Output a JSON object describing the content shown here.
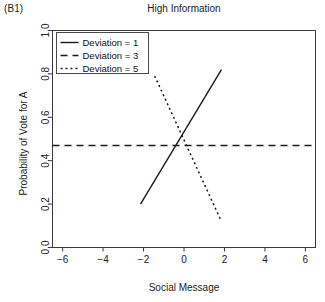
{
  "panel": {
    "label": "(B1)"
  },
  "chart_data": {
    "type": "line",
    "title": "High Information",
    "xlabel": "Social Message",
    "ylabel": "Probability of Vote for A",
    "xlim": [
      -6.5,
      6.5
    ],
    "ylim": [
      0.0,
      1.0
    ],
    "xticks": [
      -6,
      -4,
      -2,
      0,
      2,
      4,
      6
    ],
    "xticklabels": [
      "−6",
      "−4",
      "−2",
      "0",
      "2",
      "4",
      "6"
    ],
    "yticks": [
      0.0,
      0.2,
      0.4,
      0.6,
      0.8,
      1.0
    ],
    "yticklabels": [
      "0.0",
      "0.2",
      "0.4",
      "0.6",
      "0.8",
      "1.0"
    ],
    "grid": false,
    "legend_position": "top-left",
    "series": [
      {
        "name": "Deviation = 1",
        "style": "solid",
        "dash": "none",
        "color": "#1b1b1b",
        "x": [
          -2.15,
          1.85
        ],
        "y": [
          0.2,
          0.82
        ]
      },
      {
        "name": "Deviation = 3",
        "style": "dashed",
        "dash": "7,5",
        "color": "#1b1b1b",
        "x": [
          -6.5,
          6.5
        ],
        "y": [
          0.47,
          0.47
        ]
      },
      {
        "name": "Deviation = 5",
        "style": "dotted",
        "dash": "2,3",
        "color": "#1b1b1b",
        "x": [
          -1.45,
          1.8
        ],
        "y": [
          0.79,
          0.13
        ]
      }
    ]
  },
  "legend": {
    "entries": [
      {
        "label": "Deviation = 1"
      },
      {
        "label": "Deviation = 3"
      },
      {
        "label": "Deviation = 5"
      }
    ]
  }
}
